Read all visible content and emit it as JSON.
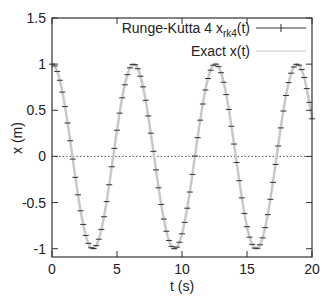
{
  "chart_data": {
    "type": "line",
    "title": "",
    "xlabel": "t (s)",
    "ylabel": "x (m)",
    "xlim": [
      0,
      20
    ],
    "ylim": [
      -1.09,
      1.5
    ],
    "grid": false,
    "legend_position": "top-right",
    "x_ticks": [
      0,
      5,
      10,
      15,
      20
    ],
    "x_tick_labels": [
      "0",
      "5",
      "10",
      "15",
      "20"
    ],
    "y_ticks": [
      -1,
      -0.5,
      0,
      0.5,
      1,
      1.5
    ],
    "y_tick_labels": [
      "-1",
      "-0.5",
      "0",
      "0.5",
      "1",
      "1.5"
    ],
    "series": [
      {
        "name": "Runge-Kutta 4 x_rk4(t)",
        "legend_main": "Runge-Kutta 4 x",
        "legend_sub": "rk4",
        "legend_tail": "(t)",
        "style": "points-with-horizontal-tick-markers",
        "color": "#333333",
        "dt": 0.2,
        "t_start": 0,
        "t_end": 20,
        "description": "numerical solution samples, x = cos(t)"
      },
      {
        "name": "Exact x(t)",
        "legend_label": "Exact x(t)",
        "style": "line",
        "color": "#c8c8c8",
        "description": "x = cos(t)"
      },
      {
        "name": "zero reference",
        "style": "dotted",
        "color": "#555555",
        "y": 0
      }
    ],
    "x": [
      0,
      0.2,
      0.4,
      0.6,
      0.8,
      1,
      1.2,
      1.4,
      1.6,
      1.8,
      2,
      2.2,
      2.4,
      2.6,
      2.8,
      3,
      3.2,
      3.4,
      3.6,
      3.8,
      4,
      4.2,
      4.4,
      4.6,
      4.8,
      5,
      5.2,
      5.4,
      5.6,
      5.8,
      6,
      6.2,
      6.4,
      6.6,
      6.8,
      7,
      7.2,
      7.4,
      7.6,
      7.8,
      8,
      8.2,
      8.4,
      8.6,
      8.8,
      9,
      9.2,
      9.4,
      9.6,
      9.8,
      10,
      10.2,
      10.4,
      10.6,
      10.8,
      11,
      11.2,
      11.4,
      11.6,
      11.8,
      12,
      12.2,
      12.4,
      12.6,
      12.8,
      13,
      13.2,
      13.4,
      13.6,
      13.8,
      14,
      14.2,
      14.4,
      14.6,
      14.8,
      15,
      15.2,
      15.4,
      15.6,
      15.8,
      16,
      16.2,
      16.4,
      16.6,
      16.8,
      17,
      17.2,
      17.4,
      17.6,
      17.8,
      18,
      18.2,
      18.4,
      18.6,
      18.8,
      19,
      19.2,
      19.4,
      19.6,
      19.8,
      20
    ],
    "values": [
      1,
      0.98,
      0.921,
      0.825,
      0.697,
      0.54,
      0.362,
      0.17,
      -0.029,
      -0.227,
      -0.416,
      -0.589,
      -0.737,
      -0.857,
      -0.942,
      -0.99,
      -0.998,
      -0.967,
      -0.897,
      -0.791,
      -0.654,
      -0.49,
      -0.307,
      -0.112,
      0.087,
      0.284,
      0.469,
      0.635,
      0.776,
      0.886,
      0.96,
      0.997,
      0.993,
      0.95,
      0.869,
      0.754,
      0.608,
      0.439,
      0.252,
      0.055,
      -0.146,
      -0.34,
      -0.52,
      -0.679,
      -0.811,
      -0.911,
      -0.975,
      -0.999,
      -0.984,
      -0.93,
      -0.839,
      -0.715,
      -0.561,
      -0.386,
      -0.195,
      0.004,
      0.203,
      0.393,
      0.568,
      0.72,
      0.844,
      0.934,
      0.988,
      1.0,
      0.973,
      0.907,
      0.804,
      0.67,
      0.509,
      0.327,
      0.134,
      -0.066,
      -0.263,
      -0.449,
      -0.618,
      -0.762,
      -0.875,
      -0.953,
      -0.994,
      -0.996,
      -0.958,
      -0.883,
      -0.772,
      -0.631,
      -0.465,
      -0.281,
      -0.087,
      0.113,
      0.309,
      0.492,
      0.66,
      0.8,
      0.902,
      0.969,
      0.998,
      0.989,
      0.941,
      0.855,
      0.735,
      0.586,
      0.408
    ]
  }
}
